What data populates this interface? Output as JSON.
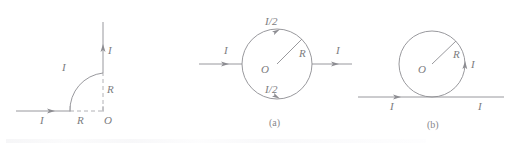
{
  "figure": {
    "width": 508,
    "height": 147,
    "background": "#ffffff",
    "stroke_color": "#8d8d92",
    "dash_color": "#a9a9ae",
    "label_color": "#7c7c80",
    "caption_color": "#87878b"
  },
  "panels": [
    {
      "id": "quarter-arc",
      "caption": "",
      "labels": {
        "current_horizontal": "I",
        "current_vertical": "I",
        "current_arc": "I",
        "radius_vertical": "R",
        "radius_horizontal": "R",
        "origin": "O"
      }
    },
    {
      "id": "split-loop",
      "caption": "(a)",
      "labels": {
        "current_in": "I",
        "current_out": "I",
        "current_top": "I/2",
        "current_bottom": "I/2",
        "radius": "R",
        "center": "O"
      }
    },
    {
      "id": "tangent-loop",
      "caption": "(b)",
      "labels": {
        "current_left": "I",
        "current_right": "I",
        "current_loop": "I",
        "radius": "R",
        "center": "O"
      }
    }
  ]
}
